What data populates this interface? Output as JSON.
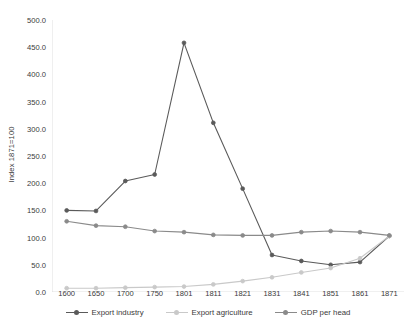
{
  "chart_data": {
    "type": "line",
    "title": "",
    "xlabel": "",
    "ylabel": "Index 1871=100",
    "categories": [
      "1600",
      "1650",
      "1700",
      "1750",
      "1801",
      "1811",
      "1821",
      "1831",
      "1841",
      "1851",
      "1861",
      "1871"
    ],
    "ylim": [
      0,
      500
    ],
    "ytick_labels": [
      "0.0",
      "50.0",
      "100.0",
      "150.0",
      "200.0",
      "250.0",
      "300.0",
      "350.0",
      "400.0",
      "450.0",
      "500.0"
    ],
    "ytick_values": [
      0,
      50,
      100,
      150,
      200,
      250,
      300,
      350,
      400,
      450,
      500
    ],
    "grid": false,
    "legend_position": "bottom",
    "series": [
      {
        "name": "Export industry",
        "color": "#5a5a5a",
        "values": [
          150,
          149,
          204,
          216,
          458,
          311,
          190,
          68,
          57,
          50,
          55,
          103
        ]
      },
      {
        "name": "Export agriculture",
        "color": "#c9c9c9",
        "values": [
          7,
          7,
          8,
          9,
          10,
          14,
          20,
          27,
          36,
          44,
          62,
          103
        ]
      },
      {
        "name": "GDP per head",
        "color": "#8a8a8a",
        "values": [
          130,
          122,
          120,
          112,
          110,
          105,
          104,
          104,
          110,
          112,
          110,
          104
        ]
      }
    ]
  },
  "legend": {
    "items": [
      {
        "label": "Export industry",
        "marker": "line-circle-marker",
        "color": "#5a5a5a"
      },
      {
        "label": "Export agriculture",
        "marker": "line-dot-marker",
        "color": "#c9c9c9"
      },
      {
        "label": "GDP per head",
        "marker": "line-circle-marker",
        "color": "#8a8a8a"
      }
    ]
  }
}
